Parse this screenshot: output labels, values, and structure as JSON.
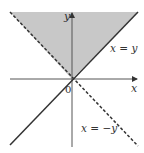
{
  "diagram": {
    "labels": {
      "x_axis": "x",
      "y_axis": "y",
      "origin": "0",
      "line_solid": "x = y",
      "line_dashed": "x = −y"
    },
    "colors": {
      "shade": "#c8c8c8",
      "line": "#333333",
      "axis": "#444444"
    },
    "region": "y ≥ |x| (shaded wedge above origin between x = y and x = −y)"
  }
}
